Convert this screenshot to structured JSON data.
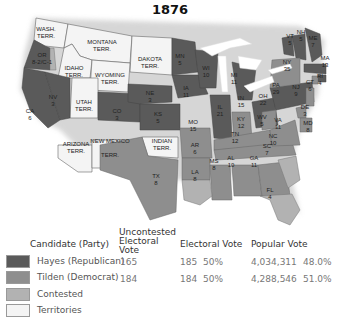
{
  "title": "1876",
  "colors": {
    "hayes": "#5a5a5a",
    "tilden": "#8e8e8e",
    "contested": "#b2b2b2",
    "territories": "#f4f4f4"
  },
  "territories": [
    {
      "name": "WASH.",
      "sub": "TERR."
    },
    {
      "name": "MONTANA",
      "sub": "TERR."
    },
    {
      "name": "DAKOTA",
      "sub": "TERR."
    },
    {
      "name": "IDAHO",
      "sub": "TERR."
    },
    {
      "name": "WYOMING",
      "sub": "TERR."
    },
    {
      "name": "UTAH",
      "sub": "TERR."
    },
    {
      "name": "ARIZONA",
      "sub": "TERR."
    },
    {
      "name": "NEW MEXICO",
      "sub": "TERR."
    },
    {
      "name": "INDIAN",
      "sub": "TERR."
    }
  ],
  "states": [
    {
      "abbr": "OR",
      "votes": "8-2/C-1",
      "winner": "contested"
    },
    {
      "abbr": "CA",
      "votes": "6",
      "winner": "hayes"
    },
    {
      "abbr": "NV",
      "votes": "3",
      "winner": "hayes"
    },
    {
      "abbr": "CO",
      "votes": "3",
      "winner": "hayes"
    },
    {
      "abbr": "NE",
      "votes": "3",
      "winner": "hayes"
    },
    {
      "abbr": "KS",
      "votes": "5",
      "winner": "hayes"
    },
    {
      "abbr": "TX",
      "votes": "8",
      "winner": "tilden"
    },
    {
      "abbr": "MN",
      "votes": "5",
      "winner": "hayes"
    },
    {
      "abbr": "IA",
      "votes": "11",
      "winner": "hayes"
    },
    {
      "abbr": "MO",
      "votes": "15",
      "winner": "tilden"
    },
    {
      "abbr": "AR",
      "votes": "6",
      "winner": "tilden"
    },
    {
      "abbr": "LA",
      "votes": "8",
      "winner": "contested"
    },
    {
      "abbr": "WI",
      "votes": "10",
      "winner": "hayes"
    },
    {
      "abbr": "IL",
      "votes": "21",
      "winner": "hayes"
    },
    {
      "abbr": "MI",
      "votes": "11",
      "winner": "hayes"
    },
    {
      "abbr": "IN",
      "votes": "15",
      "winner": "tilden"
    },
    {
      "abbr": "OH",
      "votes": "22",
      "winner": "hayes"
    },
    {
      "abbr": "KY",
      "votes": "12",
      "winner": "tilden"
    },
    {
      "abbr": "TN",
      "votes": "12",
      "winner": "tilden"
    },
    {
      "abbr": "MS",
      "votes": "8",
      "winner": "tilden"
    },
    {
      "abbr": "AL",
      "votes": "10",
      "winner": "tilden"
    },
    {
      "abbr": "GA",
      "votes": "11",
      "winner": "tilden"
    },
    {
      "abbr": "FL",
      "votes": "4",
      "winner": "contested"
    },
    {
      "abbr": "SC",
      "votes": "7",
      "winner": "contested"
    },
    {
      "abbr": "NC",
      "votes": "10",
      "winner": "tilden"
    },
    {
      "abbr": "VA",
      "votes": "11",
      "winner": "tilden"
    },
    {
      "abbr": "WV",
      "votes": "5",
      "winner": "tilden"
    },
    {
      "abbr": "PA",
      "votes": "29",
      "winner": "hayes"
    },
    {
      "abbr": "NY",
      "votes": "35",
      "winner": "tilden"
    },
    {
      "abbr": "NJ",
      "votes": "9",
      "winner": "tilden"
    },
    {
      "abbr": "DE",
      "votes": "3",
      "winner": "tilden"
    },
    {
      "abbr": "MD",
      "votes": "8",
      "winner": "tilden"
    },
    {
      "abbr": "CT",
      "votes": "6",
      "winner": "tilden"
    },
    {
      "abbr": "RI",
      "votes": "4",
      "winner": "hayes"
    },
    {
      "abbr": "MA",
      "votes": "13",
      "winner": "hayes"
    },
    {
      "abbr": "VT",
      "votes": "5",
      "winner": "hayes"
    },
    {
      "abbr": "NH",
      "votes": "5",
      "winner": "hayes"
    },
    {
      "abbr": "ME",
      "votes": "7",
      "winner": "hayes"
    }
  ],
  "legend": {
    "headers": {
      "candidate": "Candidate (Party)",
      "uncontested": "Uncontested Electoral Vote",
      "electoral": "Electoral Vote",
      "popular": "Popular Vote"
    },
    "rows": [
      {
        "label": "Hayes (Republican)",
        "uncontested": "165",
        "electoral": "185",
        "electoral_pct": "50%",
        "popular": "4,034,311",
        "popular_pct": "48.0%"
      },
      {
        "label": "Tilden (Democrat)",
        "uncontested": "184",
        "electoral": "184",
        "electoral_pct": "50%",
        "popular": "4,288,546",
        "popular_pct": "51.0%"
      },
      {
        "label": "Contested"
      },
      {
        "label": "Territories"
      }
    ]
  }
}
